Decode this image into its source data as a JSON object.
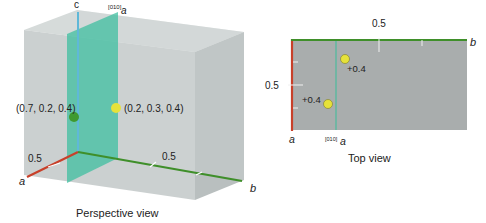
{
  "perspective_view": {
    "caption": "Perspective view",
    "axis_labels": {
      "a": "a",
      "b": "b",
      "c": "c"
    },
    "glide_plane_label": {
      "superscript": "[010]",
      "base": "a"
    },
    "tick_label_a": "0.5",
    "tick_label_b": "0.5",
    "points": [
      {
        "label": "(0.7, 0.2, 0.4)",
        "color": "#3f9a2f"
      },
      {
        "label": "(0.2, 0.3, 0.4)",
        "color": "#e6e23a"
      }
    ]
  },
  "top_view": {
    "caption": "Top view",
    "axis_labels": {
      "a": "a",
      "b": "b"
    },
    "glide_plane_label": {
      "superscript": "[010]",
      "base": "a"
    },
    "tick_label_a": "0.5",
    "tick_label_b": "0.5",
    "points": [
      {
        "label": "+0.4",
        "color": "#e6e23a"
      },
      {
        "label": "+0.4",
        "color": "#e6e23a"
      }
    ]
  },
  "colors": {
    "a_axis": "#c8402a",
    "b_axis": "#3f8f2a",
    "c_axis": "#5fb8d8",
    "glide_plane": "#3fbfa0",
    "cell": "#c9cfcf"
  }
}
